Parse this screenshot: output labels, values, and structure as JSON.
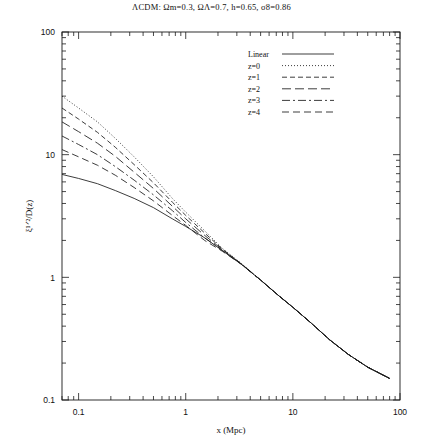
{
  "figure": {
    "title_prefix": "ΛCDM:",
    "title_full": "ΛCDM:  Ωm=0.3,  ΩΛ=0.7,  h=0.65,  σ8=0.86",
    "background": "#ffffff",
    "line_color": "#1a1a1a"
  },
  "chart_data": {
    "type": "line",
    "title": "ΛCDM:  Ωm=0.3,  ΩΛ=0.7,  h=0.65,  σ8=0.86",
    "xlabel": "x  (Mpc)",
    "ylabel": "ξ¹ᐟ²/D(z)",
    "xscale": "log",
    "yscale": "log",
    "xlim": [
      0.07,
      100
    ],
    "ylim": [
      0.1,
      100
    ],
    "xticks": [
      0.1,
      1,
      10,
      100
    ],
    "xticklabels": [
      "0.1",
      "1",
      "10",
      "100"
    ],
    "yticks": [
      0.1,
      1,
      10,
      100
    ],
    "yticklabels": [
      "0.1",
      "1",
      "10",
      "100"
    ],
    "grid": false,
    "minor_ticks": true,
    "legend_position": "upper right",
    "series": [
      {
        "name": "Linear",
        "style": "solid",
        "dash": "none",
        "x": [
          0.07,
          0.1,
          0.15,
          0.22,
          0.33,
          0.5,
          0.75,
          1.0,
          1.5,
          2.2,
          3.3,
          5.0,
          7.5,
          10.0,
          15.0,
          22.0,
          33.0,
          50.0,
          80.0
        ],
        "y": [
          6.9,
          6.4,
          5.8,
          5.1,
          4.4,
          3.7,
          3.0,
          2.6,
          2.1,
          1.65,
          1.28,
          0.95,
          0.7,
          0.57,
          0.42,
          0.31,
          0.235,
          0.185,
          0.15
        ]
      },
      {
        "name": "z=0",
        "style": "dotted",
        "dash": "1,2",
        "x": [
          0.07,
          0.1,
          0.15,
          0.22,
          0.33,
          0.5,
          0.75,
          1.0,
          1.5,
          2.2,
          3.3,
          5.0,
          7.5,
          10.0,
          15.0,
          22.0,
          33.0,
          50.0,
          80.0
        ],
        "y": [
          30.0,
          24.0,
          18.5,
          13.6,
          9.6,
          6.6,
          4.4,
          3.4,
          2.4,
          1.72,
          1.3,
          0.95,
          0.7,
          0.57,
          0.42,
          0.31,
          0.235,
          0.185,
          0.15
        ]
      },
      {
        "name": "z=1",
        "style": "dashed",
        "dash": "5,3",
        "x": [
          0.07,
          0.1,
          0.15,
          0.22,
          0.33,
          0.5,
          0.75,
          1.0,
          1.5,
          2.2,
          3.3,
          5.0,
          7.5,
          10.0,
          15.0,
          22.0,
          33.0,
          50.0,
          80.0
        ],
        "y": [
          24.0,
          19.5,
          15.2,
          11.5,
          8.3,
          5.9,
          4.1,
          3.2,
          2.3,
          1.7,
          1.29,
          0.95,
          0.7,
          0.57,
          0.42,
          0.31,
          0.235,
          0.185,
          0.15
        ]
      },
      {
        "name": "z=2",
        "style": "long-dash",
        "dash": "9,4",
        "x": [
          0.07,
          0.1,
          0.15,
          0.22,
          0.33,
          0.5,
          0.75,
          1.0,
          1.5,
          2.2,
          3.3,
          5.0,
          7.5,
          10.0,
          15.0,
          22.0,
          33.0,
          50.0,
          80.0
        ],
        "y": [
          18.5,
          15.4,
          12.4,
          9.7,
          7.2,
          5.3,
          3.8,
          3.0,
          2.2,
          1.68,
          1.285,
          0.95,
          0.7,
          0.57,
          0.42,
          0.31,
          0.235,
          0.185,
          0.15
        ]
      },
      {
        "name": "z=3",
        "style": "dash-dot",
        "dash": "8,3,2,3",
        "x": [
          0.07,
          0.1,
          0.15,
          0.22,
          0.33,
          0.5,
          0.75,
          1.0,
          1.5,
          2.2,
          3.3,
          5.0,
          7.5,
          10.0,
          15.0,
          22.0,
          33.0,
          50.0,
          80.0
        ],
        "y": [
          14.2,
          12.1,
          10.0,
          8.0,
          6.2,
          4.7,
          3.5,
          2.8,
          2.1,
          1.66,
          1.282,
          0.95,
          0.7,
          0.57,
          0.42,
          0.31,
          0.235,
          0.185,
          0.15
        ]
      },
      {
        "name": "z=4",
        "style": "medium-dash",
        "dash": "7,4",
        "x": [
          0.07,
          0.1,
          0.15,
          0.22,
          0.33,
          0.5,
          0.75,
          1.0,
          1.5,
          2.2,
          3.3,
          5.0,
          7.5,
          10.0,
          15.0,
          22.0,
          33.0,
          50.0,
          80.0
        ],
        "y": [
          11.0,
          9.6,
          8.2,
          6.8,
          5.4,
          4.2,
          3.2,
          2.65,
          2.0,
          1.63,
          1.278,
          0.95,
          0.7,
          0.57,
          0.42,
          0.31,
          0.235,
          0.185,
          0.15
        ]
      }
    ],
    "legend_entries": [
      {
        "label": "Linear",
        "style": "solid"
      },
      {
        "label": "z=0",
        "style": "dotted"
      },
      {
        "label": "z=1",
        "style": "dashed"
      },
      {
        "label": "z=2",
        "style": "long-dash"
      },
      {
        "label": "z=3",
        "style": "dash-dot"
      },
      {
        "label": "z=4",
        "style": "medium-dash"
      }
    ]
  }
}
